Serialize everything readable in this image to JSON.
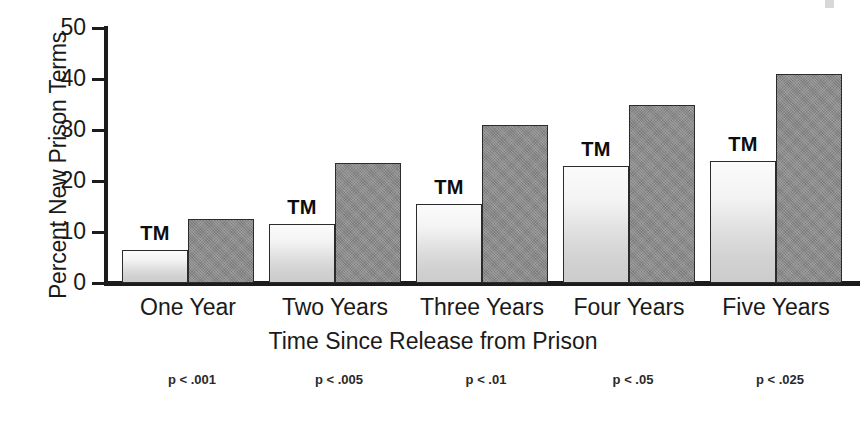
{
  "chart_data": {
    "type": "bar",
    "title": "",
    "xlabel": "Time Since Release from Prison",
    "ylabel": "Percent New Prison Terms",
    "categories": [
      "One Year",
      "Two Years",
      "Three Years",
      "Four Years",
      "Five Years"
    ],
    "ylim": [
      0,
      50
    ],
    "yticks": [
      0,
      10,
      20,
      30,
      40,
      50
    ],
    "ytick_labels": [
      "0",
      "10",
      "20",
      "30",
      "40",
      "50"
    ],
    "grid": false,
    "legend": "none",
    "series": [
      {
        "name": "TM",
        "label": "TM",
        "color": "#e6e6e6",
        "values": [
          6.5,
          11.5,
          15.5,
          23.0,
          24.0
        ]
      },
      {
        "name": "Comparison",
        "label": "",
        "color": "#8a8a8a",
        "values": [
          12.5,
          23.5,
          31.0,
          35.0,
          41.0
        ]
      }
    ],
    "bar_annotations": [
      "TM",
      "TM",
      "TM",
      "TM",
      "TM"
    ],
    "annotations": {
      "p_values": [
        "p < .001",
        "p < .005",
        "p < .01",
        "p < .05",
        "p < .025"
      ]
    }
  },
  "axis": {
    "y_label": "Percent New Prison Terms",
    "x_label": "Time Since Release from Prison"
  }
}
